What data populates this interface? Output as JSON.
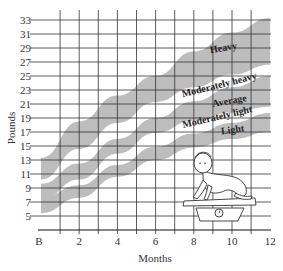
{
  "chart_data": {
    "type": "area",
    "title": "",
    "xlabel": "Months",
    "ylabel": "Pounds",
    "x_ticks": [
      "B",
      "2",
      "4",
      "6",
      "8",
      "10",
      "12"
    ],
    "x_minor_ticks": [
      1,
      3,
      5,
      7,
      9,
      11
    ],
    "y_ticks": [
      5,
      7,
      9,
      11,
      13,
      15,
      17,
      19,
      21,
      23,
      25,
      27,
      29,
      31,
      33
    ],
    "xlim": [
      0,
      12
    ],
    "ylim": [
      3,
      33
    ],
    "grid": true,
    "x": [
      0,
      2,
      4,
      6,
      8,
      10,
      12
    ],
    "bands": [
      {
        "name": "Heavy / Moderately heavy",
        "upper": [
          13.3,
          18.5,
          22.2,
          25.0,
          28.5,
          31.2,
          33.3
        ],
        "lower": [
          10.2,
          14.6,
          18.3,
          21.3,
          23.4,
          25.2,
          26.6
        ]
      },
      {
        "name": "Average",
        "upper": [
          9.6,
          12.5,
          16.0,
          19.0,
          21.4,
          23.4,
          25.0
        ],
        "lower": [
          7.3,
          10.2,
          13.9,
          16.9,
          18.6,
          19.8,
          20.6
        ]
      },
      {
        "name": "Moderately light / Light",
        "upper": [
          7.6,
          9.4,
          12.3,
          14.9,
          16.8,
          18.3,
          19.7
        ],
        "lower": [
          5.4,
          7.6,
          10.6,
          13.0,
          14.8,
          16.0,
          17.0
        ]
      }
    ],
    "band_labels": [
      "Heavy",
      "Moderately heavy",
      "Average",
      "Moderately light",
      "Light"
    ],
    "illustration": "baby crawling on a weighing scale"
  },
  "axis": {
    "x_title": "Months",
    "y_title": "Pounds"
  },
  "labels": {
    "heavy": "Heavy",
    "moderately_heavy": "Moderately heavy",
    "average": "Average",
    "moderately_light": "Moderately light",
    "light": "Light"
  },
  "colors": {
    "band": "#bdbdbd",
    "grid": "#333333",
    "background": "#ffffff"
  }
}
